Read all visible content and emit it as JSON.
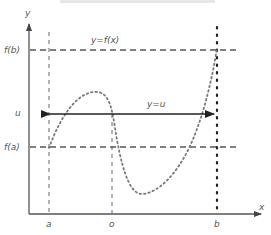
{
  "diagram": {
    "type": "intermediate-value-theorem",
    "axes": {
      "x_label": "x",
      "y_label": "y"
    },
    "x_ticks": {
      "a": "a",
      "o": "o",
      "b": "b"
    },
    "y_ticks": {
      "fb": "f(b)",
      "u": "u",
      "fa": "f(a)"
    },
    "curve_label": "y=f(x)",
    "line_label": "y=u",
    "colors": {
      "axis": "#555555",
      "dash": "#555555",
      "curve": "#777777",
      "bline": "#222222"
    }
  }
}
